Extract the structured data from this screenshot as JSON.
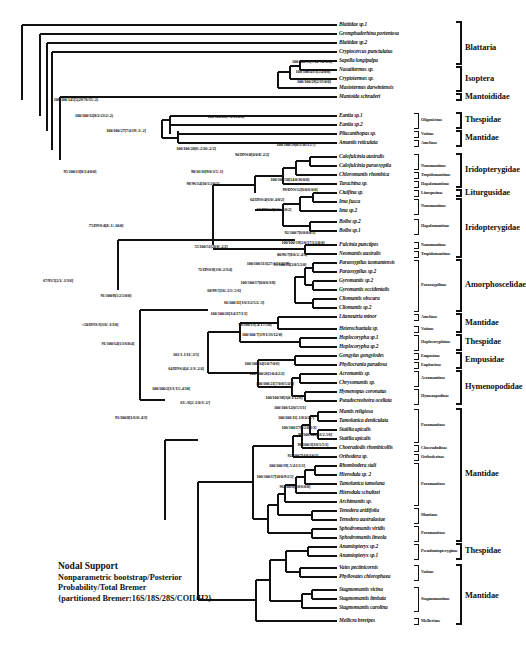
{
  "figure": {
    "type": "phylogenetic-cladogram"
  },
  "legend": {
    "heading": "Nodal Support",
    "line2": "Nonparametric bootstrap/Posterior",
    "line3": "Probability/Total Bremer",
    "line4": "{partitioned Bremer:16S/18S/28S/COII/H3}"
  },
  "taxa": [
    {
      "name": "Blattidae sp.1",
      "y": 25
    },
    {
      "name": "Gromphadorhina portentosa",
      "y": 34
    },
    {
      "name": "Blattidae sp.2",
      "y": 43
    },
    {
      "name": "Cryptocercus punctulatus",
      "y": 52
    },
    {
      "name": "Sapella longipalpa",
      "y": 61
    },
    {
      "name": "Nasutitermes sp.",
      "y": 70
    },
    {
      "name": "Cryptotermes sp.",
      "y": 79
    },
    {
      "name": "Mastotermes darwiniensis",
      "y": 88
    },
    {
      "name": "Mantoida schraderi",
      "y": 97
    },
    {
      "name": "Eantia sp.1",
      "y": 116
    },
    {
      "name": "Eantia sp.2",
      "y": 125
    },
    {
      "name": "Pliacanthopus sp.",
      "y": 134
    },
    {
      "name": "Amantis reticulata",
      "y": 143
    },
    {
      "name": "Calofulcinia australis",
      "y": 157
    },
    {
      "name": "Calofulcinia paraoxypila",
      "y": 166
    },
    {
      "name": "Chloromantis rhombica",
      "y": 175
    },
    {
      "name": "Tarachina sp.",
      "y": 184
    },
    {
      "name": "Ciulfina sp.",
      "y": 193
    },
    {
      "name": "Ima fusca",
      "y": 202
    },
    {
      "name": "Ima sp.2",
      "y": 211
    },
    {
      "name": "Bolbe sp.2",
      "y": 222
    },
    {
      "name": "Bolbe sp.1",
      "y": 231
    },
    {
      "name": "Fulcinia punctipes",
      "y": 245
    },
    {
      "name": "Neomantis australis",
      "y": 254
    },
    {
      "name": "Paraoxypilus tasmaniensis",
      "y": 263
    },
    {
      "name": "Paraoxypilus sp.2",
      "y": 272
    },
    {
      "name": "Gyromantis sp.2",
      "y": 281
    },
    {
      "name": "Gyromantis occidentalis",
      "y": 290
    },
    {
      "name": "Cliomantis obscura",
      "y": 299
    },
    {
      "name": "Cliomantis sp.2",
      "y": 308
    },
    {
      "name": "Litaneutria minor",
      "y": 317
    },
    {
      "name": "Heterochaetula sp.",
      "y": 329
    },
    {
      "name": "Hoplocorypha sp.1",
      "y": 338
    },
    {
      "name": "Hoplocorypha sp.2",
      "y": 347
    },
    {
      "name": "Gongylus gongylodes",
      "y": 356
    },
    {
      "name": "Phyllocrania paradoxa",
      "y": 365
    },
    {
      "name": "Acromantis sp.",
      "y": 374
    },
    {
      "name": "Chrysomantis sp.",
      "y": 383
    },
    {
      "name": "Hymenopus coronatus",
      "y": 392
    },
    {
      "name": "Pseudocreobotra ocellata",
      "y": 401
    },
    {
      "name": "Mantis religiosa",
      "y": 412
    },
    {
      "name": "Tamolanica denticulata",
      "y": 421
    },
    {
      "name": "Statilia apicalis",
      "y": 430
    },
    {
      "name": "Statilia apicalis",
      "y": 439
    },
    {
      "name": "Choeradodis rhombicollis",
      "y": 448
    },
    {
      "name": "Orthodera sp.",
      "y": 457
    },
    {
      "name": "Rhombodera stali",
      "y": 466
    },
    {
      "name": "Hierodula sp. 2",
      "y": 475
    },
    {
      "name": "Tamolanica tamolana",
      "y": 484
    },
    {
      "name": "Hierodula schultzei",
      "y": 493
    },
    {
      "name": "Archimantis sp.",
      "y": 502
    },
    {
      "name": "Tenodera aridifolia",
      "y": 511
    },
    {
      "name": "Tenodera australasiae",
      "y": 520
    },
    {
      "name": "Sphodromantis viridis",
      "y": 529
    },
    {
      "name": "Sphodromantis lineola",
      "y": 538
    },
    {
      "name": "Anamiopteryx sp.2",
      "y": 547
    },
    {
      "name": "Anamiopteryx sp.1",
      "y": 556
    },
    {
      "name": "Vates pectinicornis",
      "y": 568
    },
    {
      "name": "Phyllovates chlorophaea",
      "y": 577
    },
    {
      "name": "Stagmomantis vicina",
      "y": 590
    },
    {
      "name": "Stagmomantis limbata",
      "y": 599
    },
    {
      "name": "Stagmomantis carolina",
      "y": 608
    },
    {
      "name": "Mellicra brevipes",
      "y": 621
    }
  ],
  "subfamilies": [
    {
      "name": "Oligonicinae",
      "y": 120,
      "top": 113,
      "bottom": 128
    },
    {
      "name": "Vatinae",
      "y": 134,
      "top": 131,
      "bottom": 137
    },
    {
      "name": "Amelinae",
      "y": 143,
      "top": 140,
      "bottom": 146
    },
    {
      "name": "Nanomantinae",
      "y": 166,
      "top": 154,
      "bottom": 169
    },
    {
      "name": "Tropidomantinae",
      "y": 175,
      "top": 172,
      "bottom": 178
    },
    {
      "name": "Hapalomantinae",
      "y": 184,
      "top": 181,
      "bottom": 187
    },
    {
      "name": "Liturgusinae",
      "y": 193,
      "top": 190,
      "bottom": 196
    },
    {
      "name": "Nanomantinae",
      "y": 206,
      "top": 199,
      "bottom": 214
    },
    {
      "name": "Hapalomantinae",
      "y": 226,
      "top": 219,
      "bottom": 234
    },
    {
      "name": "Nanomantinae",
      "y": 245,
      "top": 242,
      "bottom": 248
    },
    {
      "name": "Tropidomantinae",
      "y": 254,
      "top": 251,
      "bottom": 257
    },
    {
      "name": "Paraoxypilinae",
      "y": 285,
      "top": 260,
      "bottom": 311
    },
    {
      "name": "Amelinae",
      "y": 317,
      "top": 314,
      "bottom": 320
    },
    {
      "name": "Vatinae",
      "y": 329,
      "top": 326,
      "bottom": 332
    },
    {
      "name": "Hoplocoryphinae",
      "y": 342,
      "top": 335,
      "bottom": 350
    },
    {
      "name": "Empusinae",
      "y": 356,
      "top": 353,
      "bottom": 359
    },
    {
      "name": "Euphusinae",
      "y": 365,
      "top": 362,
      "bottom": 368
    },
    {
      "name": "Acromantinae",
      "y": 378,
      "top": 371,
      "bottom": 386
    },
    {
      "name": "Hymenopodinae",
      "y": 396,
      "top": 389,
      "bottom": 404
    },
    {
      "name": "Paramantinae",
      "y": 425,
      "top": 409,
      "bottom": 442
    },
    {
      "name": "Choeradodinae",
      "y": 448,
      "top": 445,
      "bottom": 451
    },
    {
      "name": "Orthoderinae",
      "y": 457,
      "top": 454,
      "bottom": 460
    },
    {
      "name": "Paramantinae",
      "y": 484,
      "top": 463,
      "bottom": 505
    },
    {
      "name": "Mantinae",
      "y": 515,
      "top": 508,
      "bottom": 523
    },
    {
      "name": "Paramantinae",
      "y": 533,
      "top": 526,
      "bottom": 541
    },
    {
      "name": "Pseudomiopteryginae",
      "y": 551,
      "top": 544,
      "bottom": 559
    },
    {
      "name": "Vatinae",
      "y": 572,
      "top": 565,
      "bottom": 580
    },
    {
      "name": "Stagmomantinae",
      "y": 599,
      "top": 587,
      "bottom": 611
    },
    {
      "name": "Mellierinae",
      "y": 621,
      "top": 618,
      "bottom": 624
    }
  ],
  "families": [
    {
      "name": "Blattaria",
      "y": 48,
      "top": 22,
      "bottom": 64
    },
    {
      "name": "Isoptera",
      "y": 79,
      "top": 67,
      "bottom": 91
    },
    {
      "name": "Mantoididae",
      "y": 97,
      "top": 94,
      "bottom": 100
    },
    {
      "name": "Thespidae",
      "y": 120,
      "top": 113,
      "bottom": 128
    },
    {
      "name": "Mantidae",
      "y": 138,
      "top": 131,
      "bottom": 146
    },
    {
      "name": "Iridopterygidae",
      "y": 170,
      "top": 154,
      "bottom": 187
    },
    {
      "name": "Liturgusidae",
      "y": 193,
      "top": 190,
      "bottom": 196
    },
    {
      "name": "Iridopterygidae",
      "y": 228,
      "top": 199,
      "bottom": 257
    },
    {
      "name": "Amorphoscelidae",
      "y": 285,
      "top": 260,
      "bottom": 311
    },
    {
      "name": "Mantidae",
      "y": 323,
      "top": 314,
      "bottom": 332
    },
    {
      "name": "Thespidae",
      "y": 342,
      "top": 335,
      "bottom": 350
    },
    {
      "name": "Empusidae",
      "y": 360,
      "top": 353,
      "bottom": 368
    },
    {
      "name": "Hymenopodidae",
      "y": 387,
      "top": 371,
      "bottom": 404
    },
    {
      "name": "Mantidae",
      "y": 474,
      "top": 409,
      "bottom": 541
    },
    {
      "name": "Thespidae",
      "y": 551,
      "top": 544,
      "bottom": 559
    },
    {
      "name": "Mantidae",
      "y": 596,
      "top": 565,
      "bottom": 624
    }
  ],
  "support_values": [
    {
      "text": "100/100/145[5(29/76/35/-2)",
      "x": 76,
      "y": 100
    },
    {
      "text": "100/100/32[8/2/23/2/-2)",
      "x": 94,
      "y": 116
    },
    {
      "text": "100/100/27[7/4/19/-1/-2]",
      "x": 126,
      "y": 131
    },
    {
      "text": "100/100/28[7/6/15/0/0]",
      "x": 226,
      "y": 117
    },
    {
      "text": "100/100/91[7/12/74/-2/0]",
      "x": 312,
      "y": 62
    },
    {
      "text": "100/100/43/3[5/4/0/0]",
      "x": 313,
      "y": 72
    },
    {
      "text": "100/100/29[2/35/0/0]",
      "x": 314,
      "y": 82
    },
    {
      "text": "100/100/20[6/-2/16/-2/2]",
      "x": 196,
      "y": 149
    },
    {
      "text": "94/DNS/8[0/0/8/-2/2]",
      "x": 252,
      "y": 155
    },
    {
      "text": "100/100/59[0/1/36/15/7]",
      "x": 296,
      "y": 145
    },
    {
      "text": "100/100/50[14/0/36/0/0]",
      "x": 290,
      "y": 180
    },
    {
      "text": "99/DNS/12[6/0/6/0/0]",
      "x": 300,
      "y": 190
    },
    {
      "text": "98/16/16[9/0/3/5/-1]",
      "x": 207,
      "y": 172
    },
    {
      "text": "64/DNS/4[6/0/-4/0/2]",
      "x": 267,
      "y": 200
    },
    {
      "text": "<50/DNS/4[6/0/-4/0/2]",
      "x": 273,
      "y": 210
    },
    {
      "text": "98/96/14[10/1/2/0/1]",
      "x": 203,
      "y": 184
    },
    {
      "text": "95/100/13[8/1/4/0/0]",
      "x": 80,
      "y": 172
    },
    {
      "text": "92/100/7[6/0/0/0/1]",
      "x": 300,
      "y": 233
    },
    {
      "text": "100/100/19[2/0/17/1/2/0/0]",
      "x": 303,
      "y": 243
    },
    {
      "text": "80/96/7[8/0/2/-4/1]",
      "x": 292,
      "y": 255
    },
    {
      "text": "93/100/13[2/0/5/2/0]",
      "x": 290,
      "y": 265
    },
    {
      "text": "75/DNS/4[8/-1/-10/0]",
      "x": 106,
      "y": 226
    },
    {
      "text": "55/100/51[20/0/-2/2]",
      "x": 211,
      "y": 247
    },
    {
      "text": "71/DNS/8[3/0/-2/3/4]",
      "x": 215,
      "y": 270
    },
    {
      "text": "100/100/113[27/1/51/25/9]",
      "x": 268,
      "y": 264
    },
    {
      "text": "67/95/5[2/1/-1/3/6]",
      "x": 58,
      "y": 281
    },
    {
      "text": "68/99/5[16/-1/5/-5/6]",
      "x": 224,
      "y": 291
    },
    {
      "text": "100/100/17[0/0/6/3/8]",
      "x": 258,
      "y": 283
    },
    {
      "text": "66/100/11[3/6/3/2/5/2/-3]",
      "x": 244,
      "y": 303
    },
    {
      "text": "91/100/8[1/2/5/0/0]",
      "x": 116,
      "y": 296
    },
    {
      "text": "100/100/26[3/4/17/1/1]",
      "x": 229,
      "y": 314
    },
    {
      "text": "98/100/13[-4/17/5/0]",
      "x": 255,
      "y": 325
    },
    {
      "text": "100/100/7[3/9/1/33/12/0]",
      "x": 262,
      "y": 335
    },
    {
      "text": "<50/DNS/3[3/0/-3/3/0]",
      "x": 100,
      "y": 325
    },
    {
      "text": "91/100/14[1/1/6/0/4]",
      "x": 118,
      "y": 344
    },
    {
      "text": "101/1-1/11/-3/5]",
      "x": 186,
      "y": 355
    },
    {
      "text": "100/100/34[1/0/7/0/6]",
      "x": 262,
      "y": 364
    },
    {
      "text": "64/DNS/4[4/-1/3/-2/4]",
      "x": 186,
      "y": 369
    },
    {
      "text": "100/100/26[1/0/4/2/2]",
      "x": 267,
      "y": 374
    },
    {
      "text": "100/100/21[7/0/0/5/4/0]",
      "x": 275,
      "y": 384
    },
    {
      "text": "100/100/2[3/1/15/-4/10]",
      "x": 171,
      "y": 389
    },
    {
      "text": "100/100/38[3(0/1/12/6]",
      "x": 284,
      "y": 398
    },
    {
      "text": "100/100/12[0/5/3/1]",
      "x": 290,
      "y": 408
    },
    {
      "text": "63/-/6[2/-1/0/3/-2/]",
      "x": 195,
      "y": 403
    },
    {
      "text": "100/100/11[-1/8/4/2/7]",
      "x": 296,
      "y": 418
    },
    {
      "text": "100/100/17[9/2/0/1/3]",
      "x": 299,
      "y": 428
    },
    {
      "text": "91/100/8[1/6/0/-4/3]",
      "x": 131,
      "y": 418
    },
    {
      "text": "99/100/143[53/2-5/6]",
      "x": 315,
      "y": 435
    },
    {
      "text": "98/100/3[3/6/5/5/1]",
      "x": 313,
      "y": 445
    },
    {
      "text": "92/100/7[4/0/1/0/1]",
      "x": 303,
      "y": 456
    },
    {
      "text": "100/100/19[-5/4/1/1/1]",
      "x": 287,
      "y": 466
    },
    {
      "text": "100/100/17[10/0/9/2/5]",
      "x": 275,
      "y": 477
    },
    {
      "text": "96/100/8[9/0/6/0/0]",
      "x": 295,
      "y": 487
    }
  ]
}
